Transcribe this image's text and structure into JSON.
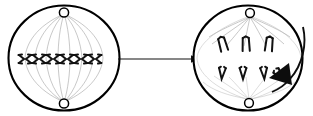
{
  "diagram": {
    "background_color": "#ffffff",
    "line_color": "#000000",
    "fiber_color": "#9a9a9a",
    "width": 313,
    "height": 116,
    "cells": [
      {
        "name": "left-cell",
        "stage_label": "",
        "center_x": 64,
        "center_y": 58,
        "radius_x": 56,
        "radius_y": 53,
        "poles": [
          {
            "name": "top-centrosome",
            "cx": 64,
            "cy": 12,
            "r": 4.6
          },
          {
            "name": "bottom-centrosome",
            "cx": 64,
            "cy": 104,
            "r": 4.6
          }
        ],
        "chromosome_count": 6,
        "chromosome_arrangement": "equatorial-plate",
        "chromosomes": [
          {
            "x": 25,
            "y": 59,
            "shape": "x-shaped"
          },
          {
            "x": 39,
            "y": 59,
            "shape": "x-shaped"
          },
          {
            "x": 53,
            "y": 59,
            "shape": "x-shaped"
          },
          {
            "x": 67,
            "y": 59,
            "shape": "x-shaped"
          },
          {
            "x": 81,
            "y": 59,
            "shape": "x-shaped"
          },
          {
            "x": 95,
            "y": 59,
            "shape": "x-shaped"
          }
        ]
      },
      {
        "name": "right-cell",
        "stage_label": "",
        "center_x": 248,
        "center_y": 58,
        "radius_x": 55,
        "radius_y": 53,
        "poles": [
          {
            "name": "top-centrosome",
            "cx": 250,
            "cy": 13,
            "r": 4.4
          },
          {
            "name": "bottom-centrosome",
            "cx": 249,
            "cy": 103,
            "r": 4.4
          }
        ],
        "chromosome_count": 7,
        "chromosome_arrangement": "two-separating-groups",
        "chromosomes_upper": [
          {
            "x": 223,
            "y": 45,
            "shape": "v-shaped"
          },
          {
            "x": 246,
            "y": 45,
            "shape": "v-shaped"
          },
          {
            "x": 269,
            "y": 45,
            "shape": "v-shaped"
          }
        ],
        "chromosomes_lower": [
          {
            "x": 222,
            "y": 74,
            "shape": "v-shaped"
          },
          {
            "x": 243,
            "y": 74,
            "shape": "v-shaped"
          },
          {
            "x": 264,
            "y": 74,
            "shape": "v-shaped"
          },
          {
            "x": 280,
            "y": 75,
            "shape": "v-shaped"
          }
        ]
      }
    ],
    "arrows": [
      {
        "name": "transition-arrow",
        "type": "straight",
        "direction": "right",
        "label": "",
        "x1": 117,
        "y1": 59,
        "x2": 195,
        "y2": 59
      },
      {
        "name": "rotation-arrow",
        "type": "curved",
        "direction": "counter-clockwise-into-cell",
        "label": "",
        "start_x": 302,
        "start_y": 30,
        "end_x": 278,
        "end_y": 86
      }
    ]
  }
}
